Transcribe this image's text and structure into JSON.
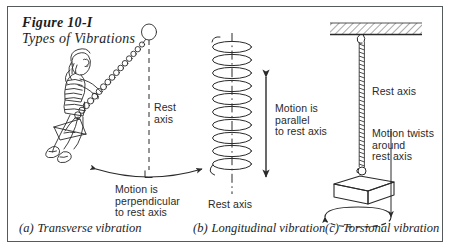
{
  "figure": {
    "title": "Figure 10-I",
    "subtitle": "Types of Vibrations",
    "border_color": "#555a5c",
    "ink_color": "#2a2a2a",
    "background": "#ffffff"
  },
  "panels": [
    {
      "id": "a",
      "tag": "(a)",
      "caption": "Transverse vibration",
      "subject": "girl-on-swing",
      "axis_label": "Rest\naxis",
      "motion_label": "Motion is\nperpendicular\nto rest axis",
      "axis_style": "dashed-vertical",
      "arrow": "double-headed-arc",
      "marker": "right-angle-square"
    },
    {
      "id": "b",
      "tag": "(b)",
      "caption": "Longitudinal vibration",
      "subject": "coil-spring",
      "axis_label": "Rest axis",
      "motion_label": "Motion is\nparallel\nto rest axis",
      "axis_style": "dash-dot-vertical",
      "arrow": "double-headed-vertical",
      "coil_turns": 9
    },
    {
      "id": "c",
      "tag": "(c)",
      "caption": "Torsional vibration",
      "subject": "block-on-twisted-cord",
      "axis_label": "Rest axis",
      "motion_label": "Motion twists\naround\nrest axis",
      "axis_style": "twisted-cord",
      "arrow": "rotation-ellipse",
      "ceiling": "hatched-support"
    }
  ]
}
